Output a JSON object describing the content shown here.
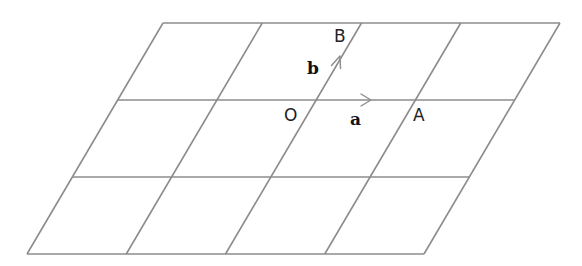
{
  "diagram": {
    "grid": {
      "rows": 3,
      "columns": 4,
      "line_color": "#8c8c8c"
    },
    "points": [
      {
        "id": "O",
        "label": "O"
      },
      {
        "id": "A",
        "label": "A"
      },
      {
        "id": "B",
        "label": "B"
      }
    ],
    "vectors": [
      {
        "id": "a",
        "label": "a",
        "from": "O",
        "to": "A"
      },
      {
        "id": "b",
        "label": "b",
        "from": "O",
        "to": "B"
      }
    ]
  }
}
